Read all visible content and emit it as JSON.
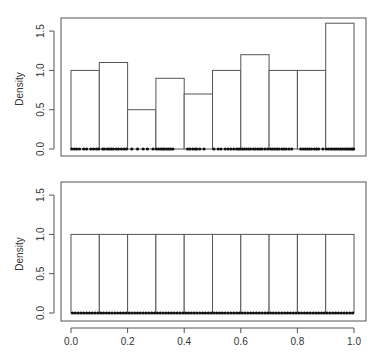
{
  "chart_data": [
    {
      "type": "bar",
      "subtype": "histogram",
      "title": "",
      "xlabel": "",
      "ylabel": "Density",
      "xlim": [
        0.0,
        1.0
      ],
      "ylim": [
        0.0,
        1.6
      ],
      "yticks": [
        0.0,
        0.5,
        1.0,
        1.5
      ],
      "ytick_labels": [
        "0.0",
        "0.5",
        "1.0",
        "1.5"
      ],
      "xticks_shown": false,
      "bin_edges": [
        0.0,
        0.1,
        0.2,
        0.3,
        0.4,
        0.5,
        0.6,
        0.7,
        0.8,
        0.9,
        1.0
      ],
      "categories": [
        "0.0-0.1",
        "0.1-0.2",
        "0.2-0.3",
        "0.3-0.4",
        "0.4-0.5",
        "0.5-0.6",
        "0.6-0.7",
        "0.7-0.8",
        "0.8-0.9",
        "0.9-1.0"
      ],
      "values": [
        1.0,
        1.1,
        0.5,
        0.9,
        0.7,
        1.0,
        1.2,
        1.0,
        1.0,
        1.6
      ],
      "rug_points": [
        0.003,
        0.012,
        0.02,
        0.03,
        0.045,
        0.055,
        0.07,
        0.08,
        0.09,
        0.098,
        0.112,
        0.118,
        0.128,
        0.135,
        0.142,
        0.15,
        0.16,
        0.168,
        0.178,
        0.188,
        0.196,
        0.215,
        0.235,
        0.255,
        0.27,
        0.29,
        0.302,
        0.31,
        0.318,
        0.325,
        0.33,
        0.338,
        0.345,
        0.352,
        0.36,
        0.412,
        0.42,
        0.43,
        0.438,
        0.445,
        0.455,
        0.47,
        0.505,
        0.52,
        0.53,
        0.545,
        0.555,
        0.565,
        0.575,
        0.585,
        0.592,
        0.598,
        0.605,
        0.612,
        0.62,
        0.628,
        0.635,
        0.645,
        0.652,
        0.66,
        0.668,
        0.675,
        0.685,
        0.695,
        0.705,
        0.712,
        0.72,
        0.728,
        0.735,
        0.745,
        0.752,
        0.76,
        0.77,
        0.78,
        0.812,
        0.82,
        0.828,
        0.835,
        0.842,
        0.85,
        0.86,
        0.868,
        0.875,
        0.89,
        0.902,
        0.91,
        0.918,
        0.925,
        0.932,
        0.938,
        0.945,
        0.952,
        0.958,
        0.965,
        0.972,
        0.978,
        0.984,
        0.99,
        0.995,
        0.999
      ],
      "grid": false,
      "legend": null
    },
    {
      "type": "bar",
      "subtype": "histogram",
      "title": "",
      "xlabel": "",
      "ylabel": "Density",
      "xlim": [
        0.0,
        1.0
      ],
      "ylim": [
        0.0,
        1.6
      ],
      "yticks": [
        0.0,
        0.5,
        1.0,
        1.5
      ],
      "ytick_labels": [
        "0.0",
        "0.5",
        "1.0",
        "1.5"
      ],
      "xticks": [
        0.0,
        0.2,
        0.4,
        0.6,
        0.8,
        1.0
      ],
      "xtick_labels": [
        "0.0",
        "0.2",
        "0.4",
        "0.6",
        "0.8",
        "1.0"
      ],
      "bin_edges": [
        0.0,
        0.1,
        0.2,
        0.3,
        0.4,
        0.5,
        0.6,
        0.7,
        0.8,
        0.9,
        1.0
      ],
      "categories": [
        "0.0-0.1",
        "0.1-0.2",
        "0.2-0.3",
        "0.3-0.4",
        "0.4-0.5",
        "0.5-0.6",
        "0.6-0.7",
        "0.7-0.8",
        "0.8-0.9",
        "0.9-1.0"
      ],
      "values": [
        1.0,
        1.0,
        1.0,
        1.0,
        1.0,
        1.0,
        1.0,
        1.0,
        1.0,
        1.0
      ],
      "rug_points": "evenly spaced: 100 points from 0.005 to 0.995 (step 0.01)",
      "rug_count": 100,
      "grid": false,
      "legend": null
    }
  ],
  "panels": [
    {
      "ylabel": "Density",
      "ytick_labels": [
        "0.0",
        "0.5",
        "1.0",
        "1.5"
      ]
    },
    {
      "ylabel": "Density",
      "ytick_labels": [
        "0.0",
        "0.5",
        "1.0",
        "1.5"
      ],
      "xtick_labels": [
        "0.0",
        "0.2",
        "0.4",
        "0.6",
        "0.8",
        "1.0"
      ]
    }
  ],
  "colors": {
    "axis": "#555555",
    "bar_stroke": "#555555",
    "bar_fill": "#ffffff",
    "rug": "#111111",
    "text": "#333333"
  }
}
